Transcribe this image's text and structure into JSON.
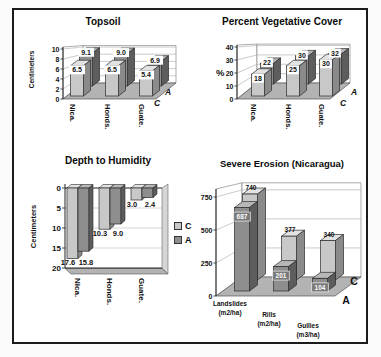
{
  "figure": {
    "background": "#ffffff",
    "frame_color": "#1b1b1b",
    "palette": {
      "floor": "#b3b3b3",
      "wall": "#ffffff",
      "gridline": "#a8a8a8",
      "bar_light_front": "#c8c8c8",
      "bar_light_top": "#e2e2e2",
      "bar_light_side": "#8a8a8a",
      "bar_dark_front": "#8e8e8e",
      "bar_dark_top": "#b7b7b7",
      "bar_dark_side": "#5d5d5d"
    }
  },
  "chart_data": [
    {
      "id": "topsoil",
      "type": "bar",
      "title": "Topsoil",
      "ylabel": "Centimeters",
      "categories": [
        "Nica.",
        "Honds.",
        "Guate."
      ],
      "ylim": [
        0,
        10
      ],
      "yticks": [
        0,
        2,
        4,
        6,
        8,
        10
      ],
      "grid": true,
      "legend_position": "depth-axis-right",
      "series": [
        {
          "name": "C",
          "row": "front",
          "values": [
            6.5,
            6.5,
            5.4
          ],
          "labels": [
            "6.5",
            "6.5",
            "5.4"
          ],
          "color": {
            "front": "#c8c8c8",
            "top": "#e2e2e2",
            "side": "#8a8a8a"
          }
        },
        {
          "name": "A",
          "row": "back",
          "values": [
            9.1,
            9.0,
            6.9
          ],
          "labels": [
            "9.1",
            "9.0",
            "6.9"
          ],
          "color": {
            "front": "#8e8e8e",
            "top": "#b7b7b7",
            "side": "#5d5d5d"
          }
        }
      ],
      "depth_axis": {
        "back_label": "A",
        "front_label": "C"
      }
    },
    {
      "id": "vegcover",
      "type": "bar",
      "title": "Percent Vegetative Cover",
      "ylabel": "%",
      "categories": [
        "Nica.",
        "Honds.",
        "Guate."
      ],
      "ylim": [
        0,
        40
      ],
      "yticks": [
        0,
        10,
        20,
        30,
        40
      ],
      "grid": true,
      "legend_position": "depth-axis-right",
      "series": [
        {
          "name": "C",
          "row": "front",
          "values": [
            18,
            25,
            30
          ],
          "labels": [
            "18",
            "25",
            "30"
          ],
          "color": {
            "front": "#c8c8c8",
            "top": "#e2e2e2",
            "side": "#8a8a8a"
          }
        },
        {
          "name": "A",
          "row": "back",
          "values": [
            22,
            30,
            32
          ],
          "labels": [
            "22",
            "30",
            "32"
          ],
          "color": {
            "front": "#8e8e8e",
            "top": "#b7b7b7",
            "side": "#5d5d5d"
          }
        }
      ],
      "depth_axis": {
        "back_label": "A",
        "front_label": "C"
      }
    },
    {
      "id": "depth-to-humidity",
      "type": "bar",
      "title": "Depth to Humidity",
      "ylabel": "Centimeters",
      "categories": [
        "Nica.",
        "Honds.",
        "Guate."
      ],
      "ylim": [
        0,
        20
      ],
      "yticks": [
        0,
        5,
        10,
        15,
        20
      ],
      "axis_inverted": true,
      "grid": true,
      "legend_position": "right",
      "series": [
        {
          "name": "C",
          "values": [
            17.6,
            10.3,
            3.0
          ],
          "labels": [
            "17.6",
            "10.3",
            "3.0"
          ],
          "color": {
            "front": "#c8c8c8",
            "top": "#e2e2e2",
            "side": "#8a8a8a"
          }
        },
        {
          "name": "A",
          "values": [
            15.8,
            9.0,
            2.4
          ],
          "labels": [
            "15.8",
            "9.0",
            "2.4"
          ],
          "color": {
            "front": "#8e8e8e",
            "top": "#b7b7b7",
            "side": "#5d5d5d"
          }
        }
      ]
    },
    {
      "id": "erosion",
      "type": "bar",
      "title": "Severe Erosion (Nicaragua)",
      "ylabel": null,
      "categories": [
        "Landslides\n(m2/ha)",
        "Rills\n(m2/ha)",
        "Gullies\n(m3/ha)"
      ],
      "ylim": [
        0,
        750
      ],
      "yticks": [
        0,
        250,
        500,
        750
      ],
      "grid": true,
      "legend_position": "depth-axis-right",
      "series": [
        {
          "name": "A",
          "row": "front",
          "values": [
            687,
            201,
            104
          ],
          "labels": [
            "687",
            "201",
            "104"
          ],
          "color": {
            "front": "#8e8e8e",
            "top": "#b7b7b7",
            "side": "#5d5d5d"
          }
        },
        {
          "name": "C",
          "row": "back",
          "values": [
            740,
            377,
            340
          ],
          "labels": [
            "740",
            "377",
            "340"
          ],
          "color": {
            "front": "#c8c8c8",
            "top": "#e2e2e2",
            "side": "#8a8a8a"
          }
        }
      ],
      "depth_axis": {
        "back_label": "C",
        "front_label": "A"
      }
    }
  ]
}
